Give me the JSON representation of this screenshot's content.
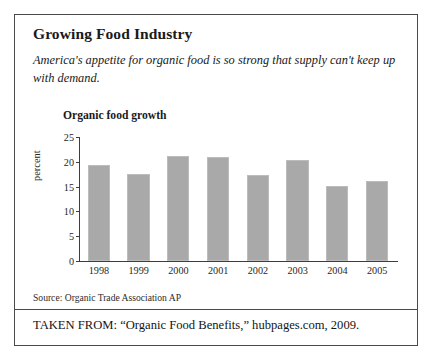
{
  "figure": {
    "headline": "Growing Food Industry",
    "lede": "America's appetite for organic food is so strong that supply can't keep up with demand.",
    "source": "Source: Organic Trade Association AP",
    "taken_from": "TAKEN FROM: “Organic Food Benefits,” hubpages.com, 2009."
  },
  "colors": {
    "bar_fill": "#a9a9a9",
    "frame": "#4a4a4a",
    "axis": "#3d3d3d",
    "page_background": "#ffffff"
  },
  "chart_data": {
    "type": "bar",
    "title": "Organic food growth",
    "xlabel": "",
    "ylabel": "percent",
    "categories": [
      "1998",
      "1999",
      "2000",
      "2001",
      "2002",
      "2003",
      "2004",
      "2005"
    ],
    "values": [
      19.4,
      17.6,
      21.1,
      20.9,
      17.4,
      20.4,
      15.2,
      16.2
    ],
    "ylim": [
      0,
      25
    ],
    "yticks": [
      0,
      5,
      10,
      15,
      20,
      25
    ],
    "ytick_labels": [
      "0",
      "5",
      "10",
      "15",
      "20",
      "25"
    ],
    "grid": false,
    "legend": null
  }
}
